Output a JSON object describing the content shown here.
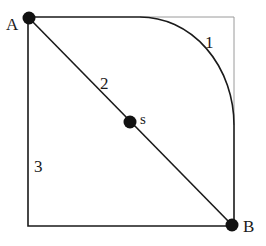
{
  "diagram": {
    "type": "path-diagram",
    "colors": {
      "line": "#1a1a1a",
      "frame_light": "#9a9a9a",
      "background": "#ffffff"
    },
    "points": [
      {
        "id": "A",
        "label": "A",
        "x": 29,
        "y": 18
      },
      {
        "id": "B",
        "label": "B",
        "x": 232,
        "y": 225
      },
      {
        "id": "s",
        "label": "s",
        "x": 130,
        "y": 122
      }
    ],
    "paths": [
      {
        "id": "1",
        "label": "1",
        "kind": "curved",
        "description": "along top edge then quarter-arc down to right edge then down to B"
      },
      {
        "id": "2",
        "label": "2",
        "kind": "straight-diagonal",
        "description": "straight line from A through s to B"
      },
      {
        "id": "3",
        "label": "3",
        "kind": "edges",
        "description": "down left edge then along bottom edge to B"
      }
    ]
  }
}
